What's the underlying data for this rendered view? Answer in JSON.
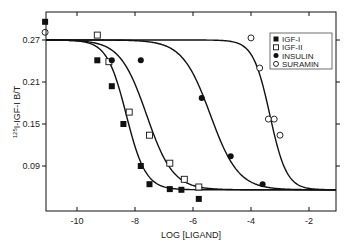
{
  "chart_data": {
    "type": "scatter",
    "title": "",
    "xlabel": "LOG [LIGAND]",
    "ylabel": "125I-IGF-I B/T",
    "ylabel_superscript": "125",
    "ylabel_main": "I-IGF-I B/T",
    "xlim": [
      -11.1,
      -0.9
    ],
    "ylim": [
      0.027,
      0.31
    ],
    "x_ticks": [
      -10,
      -8,
      -6,
      -4,
      -2
    ],
    "x_tick_labels": [
      "-10",
      "-8",
      "-6",
      "-4",
      "-2"
    ],
    "y_ticks": [
      0.27,
      0.21,
      0.15,
      0.09
    ],
    "y_tick_labels": [
      "0.27",
      "0.21",
      "0.15",
      "0.09"
    ],
    "grid": false,
    "legend_position": "upper right",
    "series": [
      {
        "name": "IGF-I",
        "marker": "filled-square",
        "points": [
          {
            "x": -11.1,
            "y": 0.296
          },
          {
            "x": -9.3,
            "y": 0.241
          },
          {
            "x": -8.8,
            "y": 0.204
          },
          {
            "x": -8.4,
            "y": 0.15
          },
          {
            "x": -7.8,
            "y": 0.09
          },
          {
            "x": -7.5,
            "y": 0.064
          },
          {
            "x": -6.8,
            "y": 0.057
          },
          {
            "x": -6.4,
            "y": 0.056
          },
          {
            "x": -5.8,
            "y": 0.043
          }
        ],
        "fit": {
          "top": 0.27,
          "bottom": 0.056,
          "log_ic50": -8.3,
          "hill": 1.3
        }
      },
      {
        "name": "IGF-II",
        "marker": "open-square",
        "points": [
          {
            "x": -9.3,
            "y": 0.277
          },
          {
            "x": -8.9,
            "y": 0.239
          },
          {
            "x": -8.2,
            "y": 0.167
          },
          {
            "x": -7.5,
            "y": 0.134
          },
          {
            "x": -6.8,
            "y": 0.094
          },
          {
            "x": -6.3,
            "y": 0.071
          },
          {
            "x": -5.8,
            "y": 0.06
          }
        ],
        "fit": {
          "top": 0.27,
          "bottom": 0.056,
          "log_ic50": -7.6,
          "hill": 0.95
        }
      },
      {
        "name": "INSULIN",
        "marker": "filled-circle",
        "points": [
          {
            "x": -8.8,
            "y": 0.241
          },
          {
            "x": -7.8,
            "y": 0.241
          },
          {
            "x": -5.7,
            "y": 0.187
          },
          {
            "x": -4.7,
            "y": 0.104
          },
          {
            "x": -3.6,
            "y": 0.064
          }
        ],
        "fit": {
          "top": 0.27,
          "bottom": 0.056,
          "log_ic50": -5.4,
          "hill": 0.9
        }
      },
      {
        "name": "SURAMIN",
        "marker": "open-circle",
        "points": [
          {
            "x": -11.1,
            "y": 0.281
          },
          {
            "x": -4.0,
            "y": 0.273
          },
          {
            "x": -3.7,
            "y": 0.23
          },
          {
            "x": -3.4,
            "y": 0.157
          },
          {
            "x": -3.2,
            "y": 0.157
          },
          {
            "x": -3.0,
            "y": 0.134
          }
        ],
        "fit": {
          "top": 0.27,
          "bottom": 0.056,
          "log_ic50": -3.35,
          "hill": 1.5
        }
      }
    ]
  },
  "legend": {
    "items": [
      "IGF-I",
      "IGF-II",
      "INSULIN",
      "SURAMIN"
    ]
  }
}
